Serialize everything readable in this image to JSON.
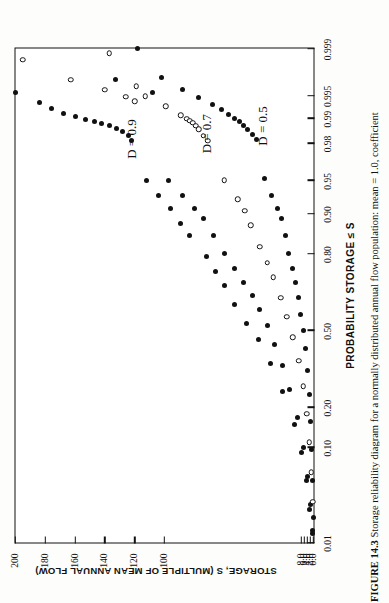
{
  "figure": {
    "caption_label": "FIGURE 14.3",
    "caption_text": "Storage reliability diagram for a normally distributed annual flow population: mean = 1.0, coefficient",
    "rotation_note": "90"
  },
  "chart_data": {
    "type": "scatter",
    "title": "",
    "xlabel": "PROBABILITY STORAGE  ≤  S",
    "ylabel": "STORAGE, S (MULTIPLE OF MEAN ANNUAL FLOW)",
    "xscale": "normal-probability",
    "xlim": [
      0.01,
      0.999
    ],
    "ylim": [
      0.0,
      200
    ],
    "grid": false,
    "legend": "inline-annotations",
    "xticks": [
      0.01,
      0.1,
      0.2,
      0.5,
      0.8,
      0.9,
      0.95,
      0.98,
      0.99,
      0.995,
      0.999
    ],
    "xticklabels": [
      "0.01",
      "0.10",
      "0.20",
      "0.50",
      "0.80",
      "0.90",
      "0.95",
      "0.98",
      "0.99",
      "0.995",
      "0.999"
    ],
    "yticks": [
      0.0,
      2.0,
      4.0,
      6.0,
      8.0,
      100,
      120,
      140,
      160,
      180,
      200
    ],
    "yticklabels": [
      "0.0",
      "2.0",
      "4.0",
      "6.0",
      "8.0",
      "100",
      "120",
      "140",
      "160",
      "180",
      "200"
    ],
    "annotations": [
      {
        "text": "D  =  0.9",
        "x": 0.982,
        "y": 122
      },
      {
        "text": "D  =  0.7",
        "x": 0.9845,
        "y": 72
      },
      {
        "text": "D  =  0.5",
        "x": 0.9875,
        "y": 34
      }
    ],
    "series": [
      {
        "name": "D = 0.9 (filled)",
        "marker": "filled-circle",
        "points": [
          [
            0.9955,
            200.0
          ],
          [
            0.9938,
            184.0
          ],
          [
            0.9925,
            176.0
          ],
          [
            0.9914,
            168.0
          ],
          [
            0.9905,
            160.0
          ],
          [
            0.9897,
            153.0
          ],
          [
            0.989,
            147.0
          ],
          [
            0.9884,
            142.0
          ],
          [
            0.9876,
            137.0
          ],
          [
            0.9866,
            132.0
          ],
          [
            0.9854,
            128.0
          ],
          [
            0.9838,
            124.0
          ],
          [
            0.9814,
            122.0
          ],
          [
            0.95,
            112.0
          ],
          [
            0.93,
            104.0
          ],
          [
            0.91,
            96.0
          ],
          [
            0.88,
            89.0
          ],
          [
            0.85,
            83.0
          ],
          [
            0.79,
            72.0
          ],
          [
            0.74,
            66.0
          ],
          [
            0.69,
            60.0
          ],
          [
            0.61,
            53.0
          ],
          [
            0.53,
            45.0
          ],
          [
            0.46,
            37.0
          ],
          [
            0.36,
            29.0
          ],
          [
            0.25,
            21.0
          ],
          [
            0.15,
            13.0
          ],
          [
            0.09,
            8.0
          ],
          [
            0.05,
            5.0
          ],
          [
            0.025,
            2.5
          ],
          [
            0.013,
            1.0
          ]
        ]
      },
      {
        "name": "D = 0.9 (open)",
        "marker": "open-circle",
        "points": [
          [
            0.9985,
            195.0
          ],
          [
            0.997,
            163.0
          ],
          [
            0.9958,
            140.0
          ],
          [
            0.9948,
            126.0
          ],
          [
            0.994,
            120.0
          ]
        ]
      },
      {
        "name": "D = 0.7 (filled)",
        "marker": "filled-circle",
        "points": [
          [
            0.997,
            133.0
          ],
          [
            0.9955,
            108.0
          ],
          [
            0.95,
            97.0
          ],
          [
            0.93,
            88.0
          ],
          [
            0.91,
            80.0
          ],
          [
            0.89,
            74.0
          ],
          [
            0.85,
            67.0
          ],
          [
            0.8,
            60.0
          ],
          [
            0.75,
            53.0
          ],
          [
            0.7,
            47.0
          ],
          [
            0.65,
            41.0
          ],
          [
            0.59,
            36.0
          ],
          [
            0.52,
            31.0
          ],
          [
            0.44,
            26.0
          ],
          [
            0.35,
            21.0
          ],
          [
            0.26,
            16.0
          ],
          [
            0.17,
            11.0
          ],
          [
            0.1,
            7.0
          ],
          [
            0.055,
            4.0
          ],
          [
            0.028,
            2.0
          ],
          [
            0.014,
            0.8
          ]
        ]
      },
      {
        "name": "D = 0.7 (open)",
        "marker": "open-circle",
        "points": [
          [
            0.9988,
            137.0
          ],
          [
            0.9963,
            119.0
          ],
          [
            0.9949,
            113.0
          ],
          [
            0.993,
            99.0
          ],
          [
            0.9908,
            89.0
          ],
          [
            0.9898,
            85.0
          ],
          [
            0.9892,
            83.0
          ],
          [
            0.9886,
            81.0
          ],
          [
            0.9876,
            79.0
          ],
          [
            0.9862,
            77.0
          ],
          [
            0.9836,
            74.0
          ],
          [
            0.9812,
            71.0
          ],
          [
            0.95,
            60.0
          ],
          [
            0.925,
            51.0
          ],
          [
            0.905,
            46.0
          ],
          [
            0.875,
            42.0
          ],
          [
            0.82,
            36.0
          ],
          [
            0.77,
            31.0
          ],
          [
            0.72,
            27.0
          ],
          [
            0.64,
            22.0
          ],
          [
            0.56,
            18.0
          ],
          [
            0.47,
            14.0
          ],
          [
            0.37,
            10.0
          ],
          [
            0.27,
            7.0
          ],
          [
            0.18,
            4.5
          ],
          [
            0.11,
            2.8
          ],
          [
            0.06,
            1.5
          ],
          [
            0.03,
            0.6
          ]
        ]
      },
      {
        "name": "D = 0.5 (filled)",
        "marker": "filled-circle",
        "points": [
          [
            0.999,
            118.0
          ],
          [
            0.9972,
            102.0
          ],
          [
            0.9958,
            88.0
          ],
          [
            0.9946,
            77.0
          ],
          [
            0.9934,
            68.0
          ],
          [
            0.9922,
            62.0
          ],
          [
            0.991,
            57.0
          ],
          [
            0.99,
            53.0
          ],
          [
            0.9889,
            50.0
          ],
          [
            0.9877,
            47.0
          ],
          [
            0.9862,
            44.0
          ],
          [
            0.984,
            41.0
          ],
          [
            0.9816,
            38.0
          ],
          [
            0.952,
            33.0
          ],
          [
            0.93,
            28.0
          ],
          [
            0.91,
            24.0
          ],
          [
            0.89,
            21.5
          ],
          [
            0.85,
            19.0
          ],
          [
            0.8,
            16.5
          ],
          [
            0.75,
            14.0
          ],
          [
            0.7,
            12.0
          ],
          [
            0.64,
            10.0
          ],
          [
            0.57,
            8.5
          ],
          [
            0.5,
            7.0
          ],
          [
            0.42,
            5.5
          ],
          [
            0.33,
            4.2
          ],
          [
            0.24,
            3.0
          ],
          [
            0.16,
            2.0
          ],
          [
            0.095,
            1.2
          ],
          [
            0.05,
            0.6
          ],
          [
            0.02,
            0.2
          ]
        ]
      }
    ]
  }
}
